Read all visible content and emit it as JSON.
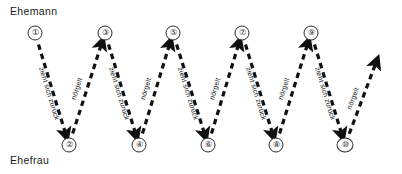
{
  "diagram": {
    "title_top": "Ehemann",
    "title_bottom": "Ehefrau",
    "colors": {
      "ink": "#111111",
      "background": "#ffffff"
    },
    "labels": {
      "withdraw": "zieht sich zurück",
      "nag": "nörgelt"
    },
    "vertices": [
      {
        "id": "v1",
        "label": "①",
        "x": 35,
        "y": 33,
        "row": "top"
      },
      {
        "id": "v2",
        "label": "②",
        "x": 69,
        "y": 145,
        "row": "bottom"
      },
      {
        "id": "v3",
        "label": "③",
        "x": 105,
        "y": 33,
        "row": "top"
      },
      {
        "id": "v4",
        "label": "④",
        "x": 139,
        "y": 145,
        "row": "bottom"
      },
      {
        "id": "v5",
        "label": "⑤",
        "x": 173,
        "y": 33,
        "row": "top"
      },
      {
        "id": "v6",
        "label": "⑥",
        "x": 208,
        "y": 145,
        "row": "bottom"
      },
      {
        "id": "v7",
        "label": "⑦",
        "x": 242,
        "y": 33,
        "row": "top"
      },
      {
        "id": "v8",
        "label": "⑧",
        "x": 276,
        "y": 145,
        "row": "bottom"
      },
      {
        "id": "v9",
        "label": "⑨",
        "x": 311,
        "y": 33,
        "row": "top"
      },
      {
        "id": "v10",
        "label": "⑩",
        "x": 345,
        "y": 145,
        "row": "bottom"
      }
    ],
    "edges": [
      {
        "id": "e1",
        "from": "v1",
        "to": "v2",
        "direction": "down",
        "label": "zieht sich zurück"
      },
      {
        "id": "e2",
        "from": "v2",
        "to": "v3",
        "direction": "up",
        "label": "nörgelt"
      },
      {
        "id": "e3",
        "from": "v3",
        "to": "v4",
        "direction": "down",
        "label": "zieht sich zurück"
      },
      {
        "id": "e4",
        "from": "v4",
        "to": "v5",
        "direction": "up",
        "label": "nörgelt"
      },
      {
        "id": "e5",
        "from": "v5",
        "to": "v6",
        "direction": "down",
        "label": "zieht sich zurück"
      },
      {
        "id": "e6",
        "from": "v6",
        "to": "v7",
        "direction": "up",
        "label": "nörgelt"
      },
      {
        "id": "e7",
        "from": "v7",
        "to": "v8",
        "direction": "down",
        "label": "zieht sich zurück"
      },
      {
        "id": "e8",
        "from": "v8",
        "to": "v9",
        "direction": "up",
        "label": "nörgelt"
      },
      {
        "id": "e9",
        "from": "v9",
        "to": "v10",
        "direction": "down",
        "label": "zieht sich zurück"
      },
      {
        "id": "e10",
        "from": "v10",
        "to": "end",
        "direction": "up",
        "label": "nörgelt"
      }
    ],
    "end_point": {
      "x": 380,
      "y": 52
    }
  }
}
